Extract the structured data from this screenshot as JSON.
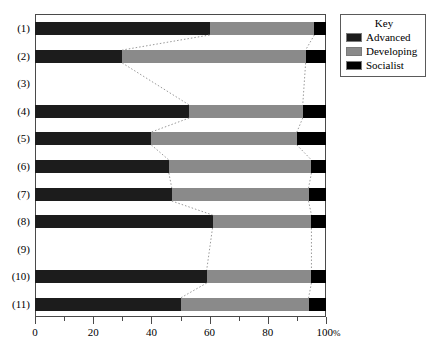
{
  "chart_data": {
    "type": "bar",
    "orientation": "horizontal",
    "stacked": true,
    "title": "",
    "xlabel": "",
    "ylabel": "",
    "xlim": [
      0,
      100
    ],
    "xunit": "%",
    "grid": false,
    "categories": [
      "(1)",
      "(2)",
      "(3)",
      "(4)",
      "(5)",
      "(6)",
      "(7)",
      "(8)",
      "(9)",
      "(10)",
      "(11)"
    ],
    "series": [
      {
        "name": "Advanced",
        "color": "#1c1c1c",
        "values": [
          60,
          30,
          null,
          53,
          40,
          46,
          47,
          61,
          null,
          59,
          50
        ]
      },
      {
        "name": "Developing",
        "color": "#8a8a8a",
        "values": [
          36,
          63,
          null,
          39,
          50,
          49,
          47,
          34,
          null,
          36,
          44
        ]
      },
      {
        "name": "Socialist",
        "color": "#000000",
        "values": [
          4,
          7,
          null,
          8,
          10,
          5,
          6,
          5,
          null,
          5,
          6
        ]
      }
    ],
    "xticks_major": [
      0,
      20,
      40,
      60,
      80,
      100
    ],
    "xticks_minor": [
      10,
      30,
      50,
      70,
      90
    ],
    "xtick_labels": [
      "0",
      "20",
      "40",
      "60",
      "80",
      "100"
    ],
    "last_tick_suffix": "%",
    "empty_categories": [
      "(3)",
      "(9)"
    ],
    "connectors_note": "dotted leader lines link segment boundaries between adjacent bars"
  },
  "legend": {
    "title": "Key",
    "position": "top-right-outside",
    "items": [
      {
        "label": "Advanced",
        "color": "#1c1c1c"
      },
      {
        "label": "Developing",
        "color": "#8a8a8a"
      },
      {
        "label": "Socialist",
        "color": "#000000"
      }
    ]
  },
  "caption": ""
}
